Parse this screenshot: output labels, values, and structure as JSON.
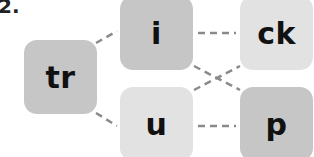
{
  "exercise_number": "2.",
  "tiles": [
    {
      "id": "tr",
      "text": "tr",
      "shade": "dark"
    },
    {
      "id": "i",
      "text": "i",
      "shade": "dark"
    },
    {
      "id": "ck",
      "text": "ck",
      "shade": "light"
    },
    {
      "id": "u",
      "text": "u",
      "shade": "light"
    },
    {
      "id": "p",
      "text": "p",
      "shade": "dark"
    }
  ],
  "connections": [
    [
      "tr",
      "i"
    ],
    [
      "tr",
      "u"
    ],
    [
      "i",
      "ck"
    ],
    [
      "i",
      "p"
    ],
    [
      "u",
      "ck"
    ],
    [
      "u",
      "p"
    ]
  ],
  "colors": {
    "dark_tile": "#c6c6c6",
    "light_tile": "#e2e2e2",
    "line": "#8a8a8a"
  }
}
